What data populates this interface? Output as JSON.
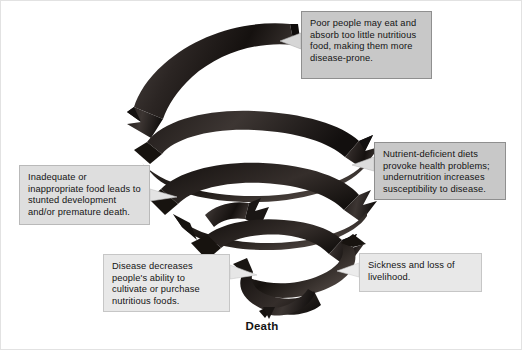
{
  "figure": {
    "bottom_label": "Death",
    "background_color": "#ffffff",
    "ribbon_color": "#241f1d",
    "callout_fill": "#c8c8c8",
    "callout_border": "#8f8f8f",
    "text_color": "#141414"
  },
  "callouts": [
    {
      "id": "poor-people",
      "text": "Poor people may eat and absorb too little nutritious food, making them more disease-prone.",
      "position": "top-right"
    },
    {
      "id": "nutrient-deficient",
      "text": "Nutrient-deficient diets provoke health problems; undernutrition increases susceptibility to disease.",
      "position": "middle-right"
    },
    {
      "id": "inadequate-food",
      "text": "Inadequate or inappropriate food leads to stunted development and/or premature death.",
      "position": "middle-left"
    },
    {
      "id": "disease-decreases",
      "text": "Disease decreases people's ability to cultivate or purchase nutritious foods.",
      "position": "bottom-left"
    },
    {
      "id": "sickness-loss",
      "text": "Sickness and loss of livelihood.",
      "position": "bottom-right"
    }
  ]
}
